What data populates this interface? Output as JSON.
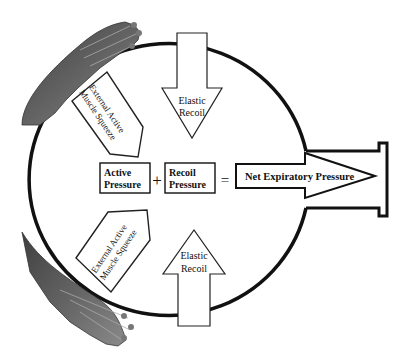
{
  "diagram": {
    "type": "physiology-schematic",
    "equation": {
      "term1": [
        "Active",
        "Pressure"
      ],
      "operator_plus": "+",
      "term2": [
        "Recoil",
        "Pressure"
      ],
      "operator_equals": "=",
      "result": "Net Expiratory Pressure"
    },
    "arrows": {
      "elastic_recoil_top": [
        "Elastic",
        "Recoil"
      ],
      "elastic_recoil_bottom": [
        "Elastic",
        "Recoil"
      ],
      "squeeze_top": [
        "External Active",
        "Muscle Squeeze"
      ],
      "squeeze_bottom": [
        "External Active",
        "Muscle Squeeze"
      ]
    },
    "figures": {
      "top_hand": "hand pressing on upper-left of chamber",
      "bottom_hand": "hand pressing on lower-left of chamber"
    },
    "colors": {
      "stroke": "#111111",
      "hand_fill": "#5a5a5a",
      "background": "#ffffff"
    }
  }
}
